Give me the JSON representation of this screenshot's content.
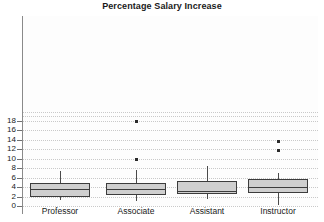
{
  "chart_data": {
    "type": "box",
    "title": "Percentage Salary Increase",
    "xlabel": "",
    "ylabel": "",
    "categories": [
      "Professor",
      "Associate",
      "Assistant",
      "Instructor"
    ],
    "ylim": [
      0,
      19.5
    ],
    "yticks": [
      0,
      2,
      4,
      6,
      8,
      10,
      12,
      14,
      16,
      18
    ],
    "ytick_labels": [
      "0",
      "2",
      "4",
      "6",
      "8",
      "10",
      "12",
      "14",
      "16",
      "18"
    ],
    "grid": true,
    "grid_style": "dotted",
    "legend": null,
    "boxes": [
      {
        "category": "Professor",
        "whisker_low": 1.2,
        "q1": 2.0,
        "median": 3.65,
        "q3": 4.9,
        "whisker_high": 7.5,
        "outliers": []
      },
      {
        "category": "Associate",
        "whisker_low": 1.1,
        "q1": 2.25,
        "median": 3.6,
        "q3": 4.9,
        "whisker_high": 7.65,
        "outliers": [
          9.9,
          17.9
        ]
      },
      {
        "category": "Assistant",
        "whisker_low": 1.55,
        "q1": 2.6,
        "median": 3.25,
        "q3": 5.4,
        "whisker_high": 8.55,
        "outliers": []
      },
      {
        "category": "Instructor",
        "whisker_low": 0.25,
        "q1": 2.7,
        "median": 4.1,
        "q3": 5.7,
        "whisker_high": 6.95,
        "outliers": [
          11.7,
          13.7
        ]
      }
    ],
    "colors": {
      "box_fill": "#cfcfcf",
      "box_stroke": "#3c3c3c",
      "whisker": "#4a4a4a",
      "outlier": "#2b2b2b",
      "grid": "#c9c9c9",
      "axis": "#8a8a8a",
      "text": "#1a1a1a",
      "plot_background": "#fdfdfd"
    }
  }
}
